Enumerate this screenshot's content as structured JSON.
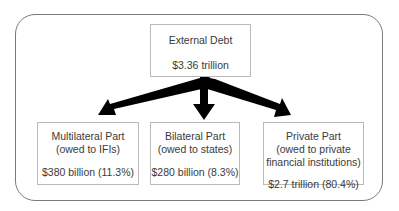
{
  "diagram": {
    "root": {
      "title": "External Debt",
      "value": "$3.36 trillion"
    },
    "children": [
      {
        "title": "Multilateral Part",
        "subtitle": "(owed to IFIs)",
        "value": "$380 billion (11.3%)"
      },
      {
        "title": "Bilateral Part",
        "subtitle": "(owed to states)",
        "value": "$280 billion (8.3%)"
      },
      {
        "title": "Private Part",
        "subtitle_line1": "(owed to private",
        "subtitle_line2": "financial institutions)",
        "value": "$2.7 trillion (80.4%)"
      }
    ],
    "colors": {
      "arrow": "#000000",
      "box_border": "#b9b9b9",
      "frame_border": "#7a7a7a",
      "text": "#3a3a3a"
    }
  }
}
